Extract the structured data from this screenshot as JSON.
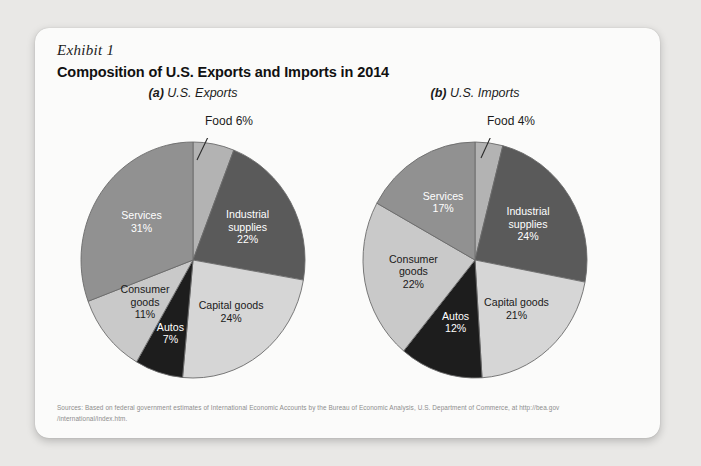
{
  "exhibit": {
    "label": "Exhibit 1",
    "title": "Composition of U.S. Exports and Imports in 2014"
  },
  "sources": {
    "line1": "Sources: Based on federal government estimates of International Economic Accounts by the Bureau of Economic Analysis, U.S. Department of Commerce, at http://bea.gov",
    "line2": "/international/index.htm."
  },
  "palette": {
    "food": "#b3b3b3",
    "industrial_supplies": "#5a5a5a",
    "capital_goods": "#d6d6d6",
    "autos": "#1d1d1d",
    "consumer_goods": "#c9c9c9",
    "services": "#919191",
    "outline": "#6b6b6b",
    "card_bg": "#fbfbfa",
    "page_bg": "#e9e8e6",
    "text": "#1b1b1b",
    "source_text": "#8d8d8d"
  },
  "chart_data": [
    {
      "type": "pie",
      "id": "us-exports",
      "title": "(a) U.S. Exports",
      "title_prefix": "(a)",
      "title_rest": " U.S. Exports",
      "callout": "Food 6%",
      "categories": [
        "Food",
        "Industrial supplies",
        "Capital goods",
        "Autos",
        "Consumer goods",
        "Services"
      ],
      "values": [
        6,
        22,
        24,
        7,
        11,
        31
      ],
      "unit": "%",
      "start_angle_deg": 0,
      "direction": "clockwise",
      "legend": "none",
      "slices": [
        {
          "name": "Food",
          "value": 6,
          "value_label": "6%",
          "color": "#b3b3b3",
          "label_lines": [],
          "label_in_slice": false,
          "label_color": "dark"
        },
        {
          "name": "Industrial supplies",
          "value": 22,
          "value_label": "22%",
          "color": "#5a5a5a",
          "label_lines": [
            "Industrial",
            "supplies",
            "22%"
          ],
          "label_in_slice": true,
          "label_color": "light"
        },
        {
          "name": "Capital goods",
          "value": 24,
          "value_label": "24%",
          "color": "#d6d6d6",
          "label_lines": [
            "Capital goods",
            "24%"
          ],
          "label_in_slice": true,
          "label_color": "dark"
        },
        {
          "name": "Autos",
          "value": 7,
          "value_label": "7%",
          "color": "#1d1d1d",
          "label_lines": [
            "Autos",
            "7%"
          ],
          "label_in_slice": true,
          "label_color": "light"
        },
        {
          "name": "Consumer goods",
          "value": 11,
          "value_label": "11%",
          "color": "#c9c9c9",
          "label_lines": [
            "Consumer",
            "goods",
            "11%"
          ],
          "label_in_slice": true,
          "label_color": "dark"
        },
        {
          "name": "Services",
          "value": 31,
          "value_label": "31%",
          "color": "#919191",
          "label_lines": [
            "Services",
            "31%"
          ],
          "label_in_slice": true,
          "label_color": "light"
        }
      ]
    },
    {
      "type": "pie",
      "id": "us-imports",
      "title": "(b) U.S. Imports",
      "title_prefix": "(b)",
      "title_rest": " U.S. Imports",
      "callout": "Food 4%",
      "categories": [
        "Food",
        "Industrial supplies",
        "Capital goods",
        "Autos",
        "Consumer goods",
        "Services"
      ],
      "values": [
        4,
        24,
        21,
        12,
        22,
        17
      ],
      "unit": "%",
      "start_angle_deg": 0,
      "direction": "clockwise",
      "legend": "none",
      "slices": [
        {
          "name": "Food",
          "value": 4,
          "value_label": "4%",
          "color": "#b3b3b3",
          "label_lines": [],
          "label_in_slice": false,
          "label_color": "dark"
        },
        {
          "name": "Industrial supplies",
          "value": 24,
          "value_label": "24%",
          "color": "#5a5a5a",
          "label_lines": [
            "Industrial",
            "supplies",
            "24%"
          ],
          "label_in_slice": true,
          "label_color": "light"
        },
        {
          "name": "Capital goods",
          "value": 21,
          "value_label": "21%",
          "color": "#d6d6d6",
          "label_lines": [
            "Capital goods",
            "21%"
          ],
          "label_in_slice": true,
          "label_color": "dark"
        },
        {
          "name": "Autos",
          "value": 12,
          "value_label": "12%",
          "color": "#1d1d1d",
          "label_lines": [
            "Autos",
            "12%"
          ],
          "label_in_slice": true,
          "label_color": "light"
        },
        {
          "name": "Consumer goods",
          "value": 22,
          "value_label": "22%",
          "color": "#c9c9c9",
          "label_lines": [
            "Consumer",
            "goods",
            "22%"
          ],
          "label_in_slice": true,
          "label_color": "dark"
        },
        {
          "name": "Services",
          "value": 17,
          "value_label": "17%",
          "color": "#919191",
          "label_lines": [
            "Services",
            "17%"
          ],
          "label_in_slice": true,
          "label_color": "light"
        }
      ]
    }
  ]
}
